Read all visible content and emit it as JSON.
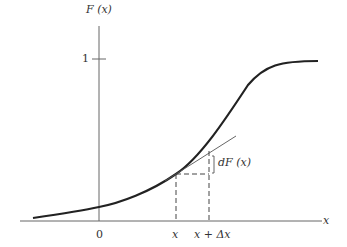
{
  "figure": {
    "y_axis_label": "F (x)",
    "x_axis_label": "x",
    "y_tick_one": "1",
    "origin_label": "0",
    "point_x_label": "x",
    "point_xdx_label": "x + Δx",
    "increment_label": "dF (x)"
  },
  "colors": {
    "curve": "#222222",
    "axis": "#555555",
    "dashed": "#444444",
    "tangent": "#555555"
  }
}
